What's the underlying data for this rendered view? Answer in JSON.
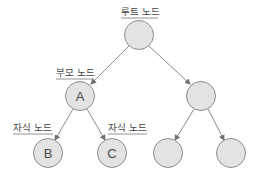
{
  "diagram": {
    "type": "tree",
    "colors": {
      "node_fill": "#e3e3e3",
      "node_stroke": "#8c8c8c",
      "edge": "#8a8a8a",
      "text": "#444444"
    },
    "nodes": [
      {
        "id": "root",
        "label": "",
        "cx": 139,
        "cy": 35
      },
      {
        "id": "A",
        "label": "A",
        "cx": 80,
        "cy": 96
      },
      {
        "id": "R",
        "label": "",
        "cx": 201,
        "cy": 96
      },
      {
        "id": "B",
        "label": "B",
        "cx": 48,
        "cy": 153
      },
      {
        "id": "C",
        "label": "C",
        "cx": 112,
        "cy": 153
      },
      {
        "id": "RL",
        "label": "",
        "cx": 168,
        "cy": 153
      },
      {
        "id": "RR",
        "label": "",
        "cx": 231,
        "cy": 153
      }
    ],
    "edges": [
      {
        "from": "root",
        "to": "A"
      },
      {
        "from": "root",
        "to": "R"
      },
      {
        "from": "A",
        "to": "B"
      },
      {
        "from": "A",
        "to": "C"
      },
      {
        "from": "R",
        "to": "RL"
      },
      {
        "from": "R",
        "to": "RR"
      }
    ],
    "captions": {
      "root": "루트 노드",
      "parent": "부모 노드",
      "child_left": "자식 노드",
      "child_right": "자식 노드"
    }
  }
}
